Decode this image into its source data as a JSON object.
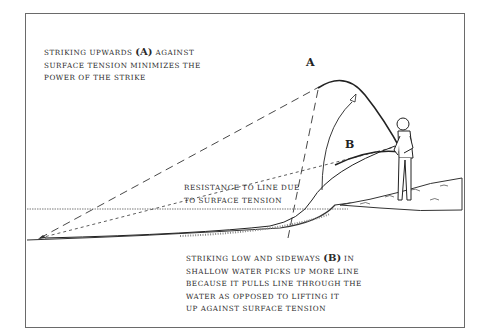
{
  "diagram": {
    "labels": {
      "a": "A",
      "b": "B"
    },
    "caption_top": {
      "line1_pre": "STRIKING UPWARDS ",
      "line1_tag": "(A)",
      "line1_post": " AGAINST",
      "line2": "SURFACE TENSION MINIMIZES THE",
      "line3": "POWER OF THE STRIKE"
    },
    "caption_middle": {
      "line1": "RESISTANCE TO LINE DUE",
      "line2": "TO SURFACE TENSION"
    },
    "caption_bottom": {
      "line1_pre": "STRIKING LOW AND SIDEWAYS ",
      "line1_tag": "(B)",
      "line1_post": " IN",
      "line2": "SHALLOW WATER PICKS UP MORE LINE",
      "line3": "BECAUSE IT PULLS LINE THROUGH THE",
      "line4": "WATER AS OPPOSED TO LIFTING IT",
      "line5": "UP AGAINST SURFACE TENSION"
    },
    "colors": {
      "ink": "#2a2a2a",
      "border": "#6a6a6a",
      "background": "#ffffff"
    }
  }
}
